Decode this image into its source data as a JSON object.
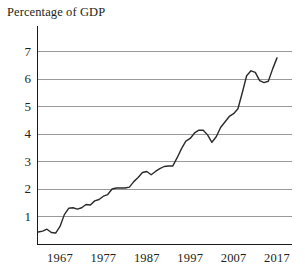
{
  "chart_data": {
    "type": "line",
    "title": "Percentage of GDP",
    "xlabel": "",
    "ylabel": "",
    "xlim": [
      1962,
      2018
    ],
    "ylim": [
      0,
      7.6
    ],
    "grid": true,
    "legend": "none",
    "y_ticks": [
      "1",
      "2",
      "3",
      "4",
      "5",
      "6",
      "7"
    ],
    "y_tick_values": [
      1,
      2,
      3,
      4,
      5,
      6,
      7
    ],
    "x_ticks": [
      "1967",
      "1977",
      "1987",
      "1997",
      "2007",
      "2017"
    ],
    "x_tick_values": [
      1967,
      1977,
      1987,
      1997,
      2007,
      2017
    ],
    "series": [
      {
        "name": "Percentage of GDP",
        "color": "#2b2b2b",
        "x": [
          1962,
          1963,
          1964,
          1965,
          1966,
          1967,
          1968,
          1969,
          1970,
          1971,
          1972,
          1973,
          1974,
          1975,
          1976,
          1977,
          1978,
          1979,
          1980,
          1981,
          1982,
          1983,
          1984,
          1985,
          1986,
          1987,
          1988,
          1989,
          1990,
          1991,
          1992,
          1993,
          1994,
          1995,
          1996,
          1997,
          1998,
          1999,
          2000,
          2001,
          2002,
          2003,
          2004,
          2005,
          2006,
          2007,
          2008,
          2009,
          2010,
          2011,
          2012,
          2013,
          2014,
          2015,
          2016,
          2017
        ],
        "y": [
          0.42,
          0.45,
          0.52,
          0.4,
          0.38,
          0.62,
          1.05,
          1.28,
          1.3,
          1.25,
          1.3,
          1.42,
          1.4,
          1.55,
          1.6,
          1.72,
          1.78,
          1.98,
          2.02,
          2.02,
          2.02,
          2.05,
          2.25,
          2.4,
          2.58,
          2.62,
          2.5,
          2.62,
          2.72,
          2.8,
          2.82,
          2.82,
          3.12,
          3.45,
          3.72,
          3.82,
          4.02,
          4.12,
          4.12,
          3.95,
          3.68,
          3.88,
          4.22,
          4.42,
          4.62,
          4.72,
          4.9,
          5.48,
          6.1,
          6.28,
          6.22,
          5.92,
          5.85,
          5.9,
          6.35,
          6.75
        ]
      }
    ]
  },
  "axes": {
    "y_axis_name": "y-axis",
    "x_axis_name": "x-axis"
  }
}
